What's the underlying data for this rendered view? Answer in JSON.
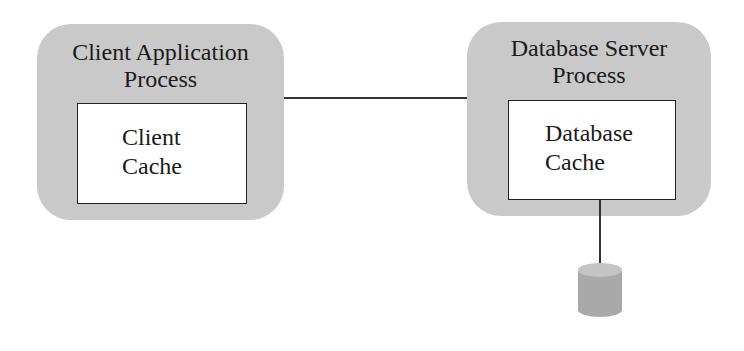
{
  "diagram": {
    "client_process": {
      "title_line1": "Client Application",
      "title_line2": "Process",
      "cache_line1": "Client",
      "cache_line2": "Cache"
    },
    "server_process": {
      "title_line1": "Database Server",
      "title_line2": "Process",
      "cache_line1": "Database",
      "cache_line2": "Cache"
    },
    "storage": {
      "icon": "database-cylinder-icon"
    },
    "connections": [
      {
        "from": "client_process",
        "to": "server_process"
      },
      {
        "from": "server_process.cache",
        "to": "storage"
      }
    ],
    "colors": {
      "process_fill": "#c9c9c9",
      "cache_fill": "#ffffff",
      "line": "#333333",
      "cylinder": "#a8a8a8"
    }
  }
}
